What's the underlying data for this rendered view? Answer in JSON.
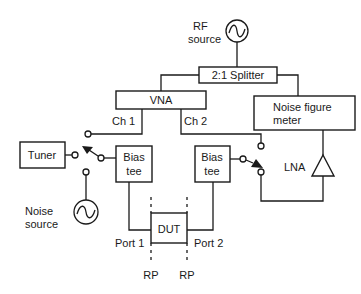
{
  "diagram": {
    "rf_source": {
      "label_line1": "RF",
      "label_line2": "source",
      "icon": "ac-source-icon"
    },
    "splitter": {
      "label": "2:1 Splitter"
    },
    "vna": {
      "label": "VNA",
      "ch1": "Ch 1",
      "ch2": "Ch 2"
    },
    "noise_figure_meter": {
      "label_line1": "Noise figure",
      "label_line2": "meter"
    },
    "tuner": {
      "label": "Tuner"
    },
    "bias_tee_1": {
      "label_line1": "Bias",
      "label_line2": "tee"
    },
    "bias_tee_2": {
      "label_line1": "Bias",
      "label_line2": "tee"
    },
    "noise_source": {
      "label_line1": "Noise",
      "label_line2": "source",
      "icon": "ac-source-icon"
    },
    "lna": {
      "label": "LNA",
      "icon": "amplifier-triangle-icon"
    },
    "dut": {
      "label": "DUT",
      "port1": "Port 1",
      "port2": "Port 2"
    },
    "reference_planes": {
      "left": "RP",
      "right": "RP"
    }
  },
  "colors": {
    "line": "#1a1a1a",
    "background": "#ffffff"
  }
}
